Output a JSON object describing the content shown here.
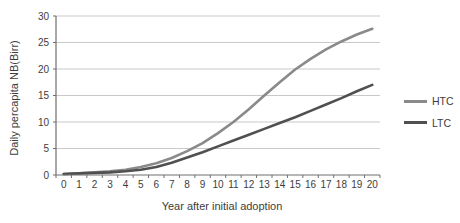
{
  "chart_data": {
    "type": "line",
    "title": "",
    "xlabel": "Year after initial adoption",
    "ylabel": "Daily percapita NB(Birr)",
    "x": [
      0,
      1,
      2,
      3,
      4,
      5,
      6,
      7,
      8,
      9,
      10,
      11,
      12,
      13,
      14,
      15,
      16,
      17,
      18,
      19,
      20
    ],
    "series": [
      {
        "name": "HTC",
        "color": "#8a8a8a",
        "values": [
          0.2,
          0.3,
          0.5,
          0.7,
          1.0,
          1.5,
          2.2,
          3.2,
          4.5,
          6.0,
          7.9,
          10.0,
          12.4,
          15.0,
          17.5,
          19.9,
          21.9,
          23.7,
          25.2,
          26.5,
          27.6
        ]
      },
      {
        "name": "LTC",
        "color": "#505050",
        "values": [
          0.2,
          0.3,
          0.4,
          0.5,
          0.7,
          1.0,
          1.5,
          2.3,
          3.3,
          4.3,
          5.4,
          6.5,
          7.6,
          8.7,
          9.8,
          10.9,
          12.1,
          13.3,
          14.5,
          15.8,
          17.0
        ]
      }
    ],
    "ylim": [
      0,
      30
    ],
    "yticks": [
      0,
      5,
      10,
      15,
      20,
      25,
      30
    ],
    "grid": true,
    "legend_position": "right"
  },
  "colors": {
    "gridline": "#c9c9c9",
    "axis": "#6e6e6e",
    "text": "#3d3d3d",
    "background": "#ffffff"
  }
}
